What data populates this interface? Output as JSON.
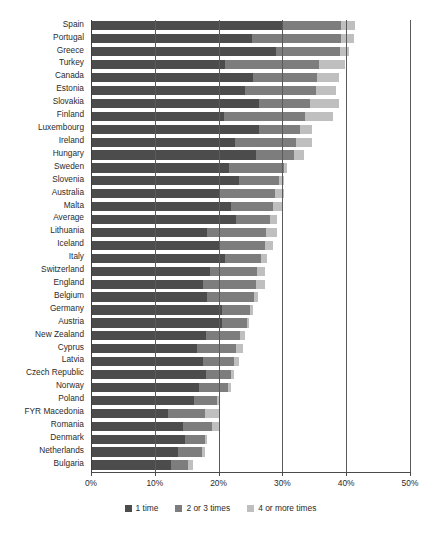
{
  "chart_data": {
    "type": "bar",
    "orientation": "horizontal",
    "stacked": true,
    "title": "",
    "xlabel": "",
    "ylabel": "",
    "xlim": [
      0,
      50
    ],
    "xtick_labels": [
      "0%",
      "10%",
      "20%",
      "30%",
      "40%",
      "50%"
    ],
    "xticks": [
      0,
      10,
      20,
      30,
      40,
      50
    ],
    "grid": true,
    "grid_axis": "x",
    "legend_position": "bottom",
    "series": [
      {
        "name": "1 time",
        "color": "#4c4c4c",
        "values": [
          30.0,
          25.2,
          29.0,
          21.0,
          25.4,
          24.2,
          26.4,
          20.9,
          26.4,
          22.6,
          25.8,
          21.7,
          23.2,
          20.2,
          22.0,
          22.8,
          18.2,
          20.0,
          21.0,
          18.6,
          17.6,
          18.2,
          20.6,
          20.6,
          18.0,
          16.6,
          17.6,
          18.0,
          17.0,
          16.2,
          12.0,
          14.4,
          14.8,
          13.6,
          12.6
        ]
      },
      {
        "name": "2 or 3 times",
        "color": "#7d7d7d",
        "values": [
          9.2,
          14.0,
          10.0,
          14.8,
          10.0,
          11.0,
          8.0,
          12.6,
          6.4,
          9.6,
          6.0,
          8.6,
          6.2,
          8.6,
          6.5,
          5.2,
          9.2,
          7.2,
          5.6,
          7.4,
          8.2,
          7.4,
          4.4,
          3.8,
          5.4,
          6.2,
          4.8,
          4.0,
          4.4,
          3.6,
          5.8,
          4.6,
          3.0,
          3.8,
          2.6
        ]
      },
      {
        "name": "4 or more times",
        "color": "#bfbfbf",
        "values": [
          2.2,
          2.0,
          1.4,
          4.0,
          3.4,
          3.2,
          4.4,
          4.4,
          1.8,
          2.4,
          1.6,
          0.5,
          0.8,
          1.4,
          1.6,
          1.2,
          1.8,
          1.4,
          1.0,
          1.2,
          1.4,
          0.6,
          0.4,
          0.4,
          0.8,
          1.0,
          0.8,
          0.4,
          0.6,
          0.4,
          2.4,
          1.2,
          0.4,
          0.4,
          0.8
        ]
      }
    ],
    "categories": [
      "Spain",
      "Portugal",
      "Greece",
      "Turkey",
      "Canada",
      "Estonia",
      "Slovakia",
      "Finland",
      "Luxembourg",
      "Ireland",
      "Hungary",
      "Sweden",
      "Slovenia",
      "Australia",
      "Malta",
      "Average",
      "Lithuania",
      "Iceland",
      "Italy",
      "Switzerland",
      "England",
      "Belgium",
      "Germany",
      "Austria",
      "New Zealand",
      "Cyprus",
      "Latvia",
      "Czech Republic",
      "Norway",
      "Poland",
      "FYR Macedonia",
      "Romania",
      "Denmark",
      "Netherlands",
      "Bulgaria"
    ],
    "totals": [
      41.4,
      41.2,
      40.4,
      39.8,
      38.8,
      38.4,
      38.8,
      37.9,
      34.6,
      34.6,
      33.4,
      30.8,
      30.2,
      30.2,
      30.1,
      29.2,
      29.2,
      28.6,
      27.6,
      27.2,
      27.2,
      26.2,
      25.4,
      24.8,
      24.2,
      23.8,
      23.2,
      22.4,
      22.0,
      20.2,
      20.2,
      20.2,
      18.2,
      17.8,
      16.0
    ]
  }
}
